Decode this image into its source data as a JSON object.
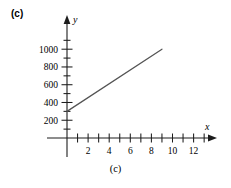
{
  "figure": {
    "panel_label": "(c)",
    "caption": "(c)"
  },
  "chart_data": {
    "type": "line",
    "title": "",
    "xlabel": "x",
    "ylabel": "y",
    "xlim": [
      -1,
      14
    ],
    "ylim": [
      0,
      1100
    ],
    "grid": false,
    "legend": null,
    "x_tick_labels": [
      "2",
      "4",
      "6",
      "8",
      "10",
      "12"
    ],
    "x_tick_values": [
      2,
      4,
      6,
      8,
      10,
      12
    ],
    "x_minor_ticks": [
      1,
      3,
      5,
      7,
      9,
      11,
      13
    ],
    "y_tick_labels": [
      "200",
      "400",
      "600",
      "800",
      "1000"
    ],
    "y_tick_values": [
      200,
      400,
      600,
      800,
      1000
    ],
    "y_minor_ticks": [
      100,
      300,
      500,
      700,
      900,
      1100
    ],
    "series": [
      {
        "name": "line",
        "x": [
          0,
          9
        ],
        "y": [
          300,
          1000
        ],
        "intercept": 300,
        "slope": 77.8,
        "color": "#545454"
      }
    ]
  },
  "axes": {
    "x_axis_arrow": "arrow-right",
    "y_axis_arrow": "arrow-up"
  }
}
